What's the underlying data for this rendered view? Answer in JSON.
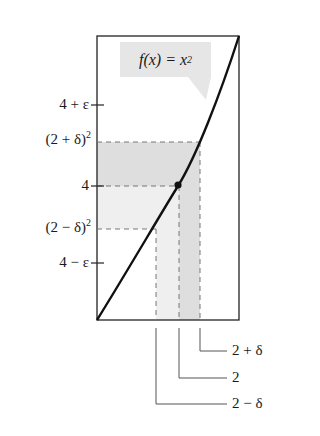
{
  "diagram": {
    "function_label": "f(x) = x",
    "function_label_exponent": "2",
    "y_labels": {
      "four_plus_eps": "4 + ε",
      "two_plus_delta_sq": "(2 + δ)",
      "two_plus_delta_sq_exp": "2",
      "four": "4",
      "two_minus_delta_sq": "(2 − δ)",
      "two_minus_delta_sq_exp": "2",
      "four_minus_eps": "4 − ε"
    },
    "x_labels": {
      "two_plus_delta": "2 + δ",
      "two": "2",
      "two_minus_delta": "2 − δ"
    },
    "colors": {
      "curve": "#111111",
      "dark_band": "#dedede",
      "light_band": "#efefef",
      "dashed": "#777777",
      "callout_bg": "#e6e6e6"
    }
  }
}
